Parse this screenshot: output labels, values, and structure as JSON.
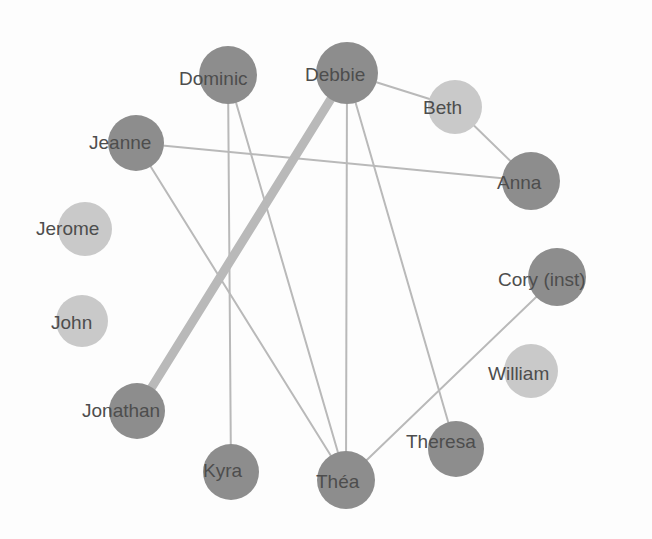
{
  "diagram": {
    "type": "social-network-graph",
    "title": "",
    "background_color": "#fdfdfd",
    "node_colors": {
      "active": "#8d8d8d",
      "inactive": "#c9c9c9"
    },
    "edge_color": "#b9b9b9",
    "label_color": "#4d4d4d",
    "layout": "circular"
  },
  "nodes": [
    {
      "id": "dominic",
      "label": "Dominic",
      "cx": 228,
      "cy": 75,
      "r": 29,
      "state": "active",
      "label_x": 179,
      "label_y": 86,
      "font_size": 19,
      "anchor": "start"
    },
    {
      "id": "debbie",
      "label": "Debbie",
      "cx": 347,
      "cy": 73,
      "r": 31,
      "state": "active",
      "label_x": 305,
      "label_y": 82,
      "font_size": 19,
      "anchor": "start"
    },
    {
      "id": "beth",
      "label": "Beth",
      "cx": 455,
      "cy": 107,
      "r": 27,
      "state": "inactive",
      "label_x": 423,
      "label_y": 115,
      "font_size": 19,
      "anchor": "start"
    },
    {
      "id": "jeanne",
      "label": "Jeanne",
      "cx": 136,
      "cy": 143,
      "r": 28,
      "state": "active",
      "label_x": 89,
      "label_y": 150,
      "font_size": 19,
      "anchor": "start"
    },
    {
      "id": "anna",
      "label": "Anna",
      "cx": 531,
      "cy": 181,
      "r": 29,
      "state": "active",
      "label_x": 497,
      "label_y": 190,
      "font_size": 19,
      "anchor": "start"
    },
    {
      "id": "jerome",
      "label": "Jerome",
      "cx": 85,
      "cy": 229,
      "r": 27,
      "state": "inactive",
      "label_x": 36,
      "label_y": 236,
      "font_size": 19,
      "anchor": "start"
    },
    {
      "id": "cory",
      "label": "Cory (inst)",
      "cx": 557,
      "cy": 277,
      "r": 29,
      "state": "active",
      "label_x": 498,
      "label_y": 287,
      "font_size": 19,
      "anchor": "start"
    },
    {
      "id": "john",
      "label": "John",
      "cx": 82,
      "cy": 321,
      "r": 26,
      "state": "inactive",
      "label_x": 51,
      "label_y": 330,
      "font_size": 19,
      "anchor": "start"
    },
    {
      "id": "william",
      "label": "William",
      "cx": 531,
      "cy": 371,
      "r": 27,
      "state": "inactive",
      "label_x": 488,
      "label_y": 381,
      "font_size": 19,
      "anchor": "start"
    },
    {
      "id": "jonathan",
      "label": "Jonathan",
      "cx": 137,
      "cy": 411,
      "r": 28,
      "state": "active",
      "label_x": 82,
      "label_y": 418,
      "font_size": 19,
      "anchor": "start"
    },
    {
      "id": "theresa",
      "label": "Theresa",
      "cx": 456,
      "cy": 449,
      "r": 28,
      "state": "active",
      "label_x": 406,
      "label_y": 449,
      "font_size": 19,
      "anchor": "start"
    },
    {
      "id": "kyra",
      "label": "Kyra",
      "cx": 231,
      "cy": 472,
      "r": 28,
      "state": "active",
      "label_x": 203,
      "label_y": 478,
      "font_size": 19,
      "anchor": "start"
    },
    {
      "id": "thea",
      "label": "Théa",
      "cx": 346,
      "cy": 480,
      "r": 29,
      "state": "active",
      "label_x": 316,
      "label_y": 489,
      "font_size": 19,
      "anchor": "start"
    }
  ],
  "edges": [
    {
      "source": "debbie",
      "target": "jonathan",
      "width": 9,
      "weight": "heavy"
    },
    {
      "source": "debbie",
      "target": "beth",
      "width": 2,
      "weight": "light"
    },
    {
      "source": "debbie",
      "target": "thea",
      "width": 2,
      "weight": "light"
    },
    {
      "source": "debbie",
      "target": "theresa",
      "width": 2,
      "weight": "light"
    },
    {
      "source": "beth",
      "target": "anna",
      "width": 2,
      "weight": "light"
    },
    {
      "source": "jeanne",
      "target": "anna",
      "width": 2,
      "weight": "light"
    },
    {
      "source": "jeanne",
      "target": "thea",
      "width": 2,
      "weight": "light"
    },
    {
      "source": "dominic",
      "target": "kyra",
      "width": 2,
      "weight": "light"
    },
    {
      "source": "dominic",
      "target": "thea",
      "width": 2,
      "weight": "light"
    },
    {
      "source": "cory",
      "target": "thea",
      "width": 2,
      "weight": "light"
    }
  ],
  "isolated_nodes": [
    "jerome",
    "john",
    "william"
  ]
}
